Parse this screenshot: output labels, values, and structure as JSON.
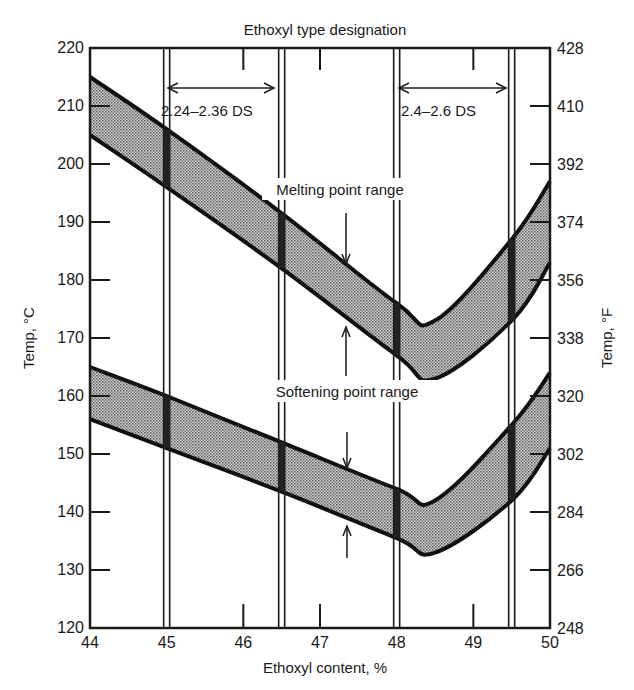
{
  "chart_data": {
    "type": "area",
    "title": "Ethoxyl type designation",
    "xlabel": "Ethoxyl content, %",
    "ylabel": "Temp, °C",
    "ylabel_right": "Temp, °F",
    "xlim": [
      44,
      50
    ],
    "ylim": [
      120,
      220
    ],
    "ylim_right": [
      248,
      428
    ],
    "x_ticks": [
      "44",
      "45",
      "46",
      "47",
      "48",
      "49",
      "50"
    ],
    "y_ticks": [
      "120",
      "130",
      "140",
      "150",
      "160",
      "170",
      "180",
      "190",
      "200",
      "210",
      "220"
    ],
    "y_ticks_right": [
      "248",
      "266",
      "284",
      "302",
      "320",
      "338",
      "356",
      "374",
      "392",
      "410",
      "428"
    ],
    "grid": false,
    "series": [
      {
        "name": "Melting point range",
        "x": [
          44,
          45,
          46.5,
          48,
          48.5,
          49.5,
          50
        ],
        "upper": [
          215,
          206,
          191.5,
          176,
          173,
          187,
          197
        ],
        "lower": [
          205,
          196,
          182,
          167,
          163,
          173,
          183
        ]
      },
      {
        "name": "Softening point range",
        "x": [
          44,
          45,
          46.5,
          48,
          48.5,
          49.5,
          50
        ],
        "upper": [
          165,
          160,
          152,
          144,
          142,
          155,
          164
        ],
        "lower": [
          156,
          151,
          143.5,
          135.5,
          133,
          142,
          151
        ]
      }
    ],
    "designation_bands": [
      {
        "label": "2.24–2.36 DS",
        "x_start": 45,
        "x_end": 46.5
      },
      {
        "label": "2.4–2.6 DS",
        "x_start": 48,
        "x_end": 49.5
      }
    ],
    "annotations": [
      "Melting point range",
      "Softening point range",
      "2.24–2.36 DS",
      "2.4–2.6 DS"
    ]
  }
}
